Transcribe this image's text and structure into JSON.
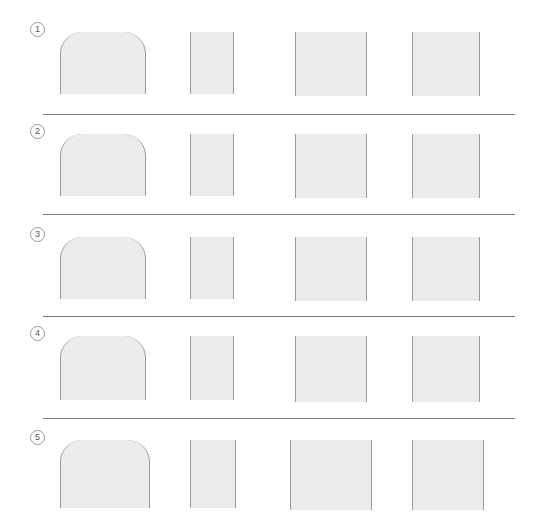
{
  "diagram": {
    "type": "staged-development-chart",
    "columns": [
      "front-torso",
      "side-torso",
      "lower-body-a",
      "lower-body-b"
    ],
    "stages": [
      {
        "label": "1",
        "top": 10
      },
      {
        "label": "2",
        "top": 112
      },
      {
        "label": "3",
        "top": 215
      },
      {
        "label": "4",
        "top": 318
      },
      {
        "label": "5",
        "top": 420
      }
    ]
  }
}
